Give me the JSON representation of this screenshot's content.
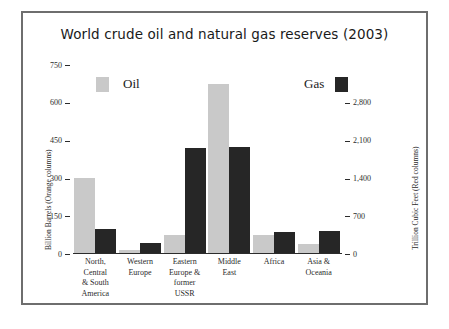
{
  "chart_data": {
    "type": "bar",
    "title": "World crude oil and natural gas reserves (2003)",
    "categories": [
      "North, Central & South America",
      "Western Europe",
      "Eastern Europe & former USSR",
      "Middle East",
      "Africa",
      "Asia & Oceania"
    ],
    "category_lines": [
      [
        "North,",
        "Central",
        "& South",
        "America"
      ],
      [
        "Western",
        "Europe"
      ],
      [
        "Eastern",
        "Europe &",
        "former",
        "USSR"
      ],
      [
        "Middle",
        "East"
      ],
      [
        "Africa"
      ],
      [
        "Asia &",
        "Oceania"
      ]
    ],
    "series": [
      {
        "name": "Oil",
        "axis": "left",
        "unit": "Billion Barrels",
        "color": "#c9c9c9",
        "values": [
          302,
          17,
          77,
          673,
          77,
          38
        ]
      },
      {
        "name": "Gas",
        "axis": "right",
        "unit": "Trillion Cubic Feet",
        "color": "#262626",
        "values": [
          465,
          210,
          1960,
          1980,
          410,
          425
        ]
      }
    ],
    "xlabel": "",
    "ylabel": "Billion Barrels (Orange columns)",
    "y2label": "Trillion Cubic Feet (Red columns)",
    "ylim": [
      0,
      750
    ],
    "y2lim": [
      0,
      3500
    ],
    "yticks": [
      "0",
      "150",
      "300",
      "450",
      "600",
      "750"
    ],
    "ytick_values": [
      0,
      150,
      300,
      450,
      600,
      750
    ],
    "y2ticks": [
      "0",
      "700",
      "1,400",
      "2,100",
      "2,800"
    ],
    "y2tick_values": [
      0,
      700,
      1400,
      2100,
      2800
    ],
    "grid": false,
    "legend": [
      {
        "label": "Oil",
        "color": "#c9c9c9"
      },
      {
        "label": "Gas",
        "color": "#262626"
      }
    ],
    "legend_position": "inside-top"
  }
}
